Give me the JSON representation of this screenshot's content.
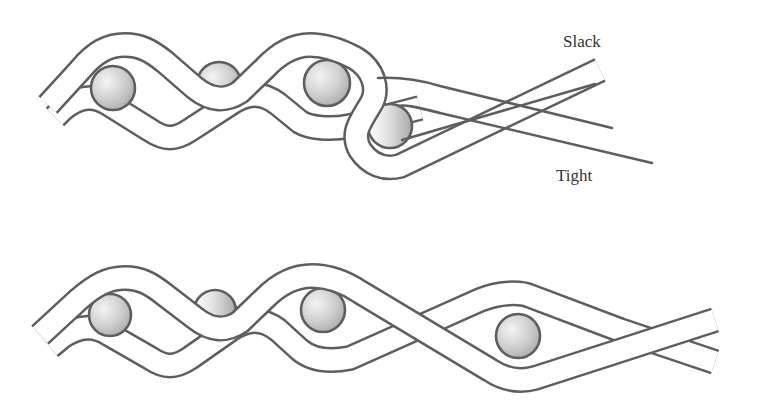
{
  "figure": {
    "top_panel": {
      "labels": {
        "slack": "Slack",
        "tight": "Tight"
      },
      "ball_count": 4
    },
    "bottom_panel": {
      "ball_count": 4
    },
    "colors": {
      "stroke": "#5e5e5e",
      "ball_light": "#ffffff",
      "ball_dark": "#b5b5b5",
      "background": "#ffffff"
    }
  }
}
